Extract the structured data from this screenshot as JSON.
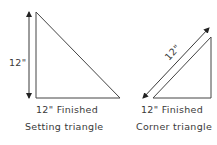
{
  "setting_triangle": {
    "dimension_label": "12\"",
    "finished_label": "12\" Finished",
    "caption": "Setting triangle"
  },
  "corner_triangle": {
    "dimension_label": "12\"",
    "finished_label": "12\" Finished",
    "caption": "Corner triangle"
  },
  "colors": {
    "stroke": "#3a3a3a",
    "background": "#ffffff"
  }
}
